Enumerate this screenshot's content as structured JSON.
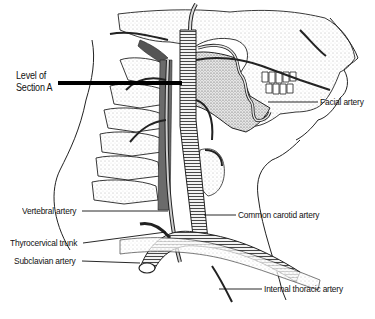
{
  "figure": {
    "type": "anatomical-illustration",
    "colors": {
      "line": "#1a1a1a",
      "shade": "#9a9a9a",
      "background": "#ffffff",
      "section_bar": "#000000"
    }
  },
  "labels": {
    "section_line_1": "Level of",
    "section_line_2": "Section A",
    "facial_artery": "Facial artery",
    "vertebral_artery": "Vertebral artery",
    "common_carotid_artery": "Common carotid artery",
    "thyrocervical_trunk": "Thyrocervical trunk",
    "subclavian_artery": "Subclavian artery",
    "internal_thoracic_artery": "Internal thoracic artery"
  }
}
